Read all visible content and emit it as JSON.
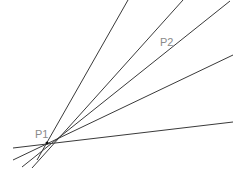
{
  "points": [
    {
      "label": "P1",
      "x": 47,
      "y": 143,
      "label_x": 35,
      "label_y": 138
    },
    {
      "label": "P2",
      "x": 170,
      "y": 44,
      "label_x": 160,
      "label_y": 46
    }
  ],
  "lines": [
    {
      "x1": 13,
      "y1": 148,
      "x2": 233,
      "y2": 122
    },
    {
      "x1": 13,
      "y1": 160,
      "x2": 233,
      "y2": 55
    },
    {
      "x1": 22,
      "y1": 167,
      "x2": 230,
      "y2": 1
    },
    {
      "x1": 32,
      "y1": 168,
      "x2": 183,
      "y2": 0
    },
    {
      "x1": 37,
      "y1": 160,
      "x2": 128,
      "y2": 0
    }
  ],
  "colors": {
    "line": "#3a3a3a",
    "label": "#8a8a8a",
    "background": "#ffffff"
  }
}
